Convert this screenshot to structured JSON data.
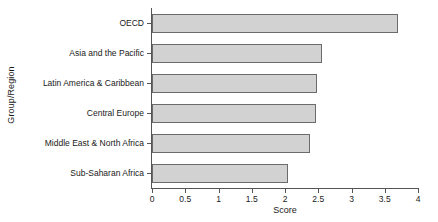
{
  "chart_data": {
    "type": "bar",
    "orientation": "horizontal",
    "title": "",
    "xlabel": "Score",
    "ylabel": "Group/Region",
    "categories": [
      "OECD",
      "Asia and the Pacific",
      "Latin America & Caribbean",
      "Central Europe",
      "Middle East & North Africa",
      "Sub-Saharan Africa"
    ],
    "values": [
      3.7,
      2.55,
      2.48,
      2.47,
      2.38,
      2.05
    ],
    "xlim": [
      0,
      4
    ],
    "xticks": [
      0,
      0.5,
      1,
      1.5,
      2,
      2.5,
      3,
      3.5,
      4
    ],
    "xtick_labels": [
      "0",
      "0.5",
      "1",
      "1.5",
      "2",
      "2.5",
      "3",
      "3.5",
      "4"
    ],
    "grid": false,
    "legend": false,
    "bar_fill_color": "#d2d2d2",
    "bar_edge_color": "#6b6b6b",
    "axis_color": "#555555",
    "background_color": "#ffffff"
  }
}
